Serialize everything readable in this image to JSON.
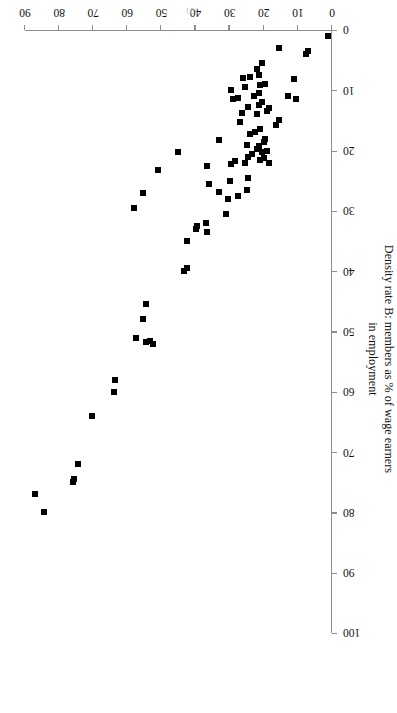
{
  "figure": {
    "page_number": "121",
    "rotation_degrees": 180
  },
  "chart_data": {
    "type": "scatter",
    "title": "",
    "xlabel": "Density rate A: members as % of non-agricultural labour force",
    "ylabel": "Density rate B:  members as % of wage earners in employment",
    "ylabel_line1": "Density rate B:  members as % of wage earners",
    "ylabel_line2": "in employment",
    "xlim": [
      0,
      90
    ],
    "ylim": [
      0,
      100
    ],
    "xticks": [
      0,
      10,
      20,
      30,
      40,
      50,
      60,
      70,
      80,
      90
    ],
    "yticks": [
      0,
      10,
      20,
      30,
      40,
      50,
      60,
      70,
      80,
      90,
      100
    ],
    "grid": false,
    "legend": false,
    "marker": "square",
    "marker_color": "#000000",
    "marker_size_px": 6,
    "points": [
      [
        1.2,
        1.0
      ],
      [
        7.0,
        3.5
      ],
      [
        7.5,
        4.0
      ],
      [
        15.5,
        3.0
      ],
      [
        20.5,
        5.5
      ],
      [
        22.0,
        6.5
      ],
      [
        21.5,
        7.5
      ],
      [
        24.0,
        7.8
      ],
      [
        26.0,
        8.0
      ],
      [
        11.0,
        8.2
      ],
      [
        19.5,
        9.0
      ],
      [
        21.0,
        9.2
      ],
      [
        25.5,
        9.5
      ],
      [
        29.5,
        10.0
      ],
      [
        21.5,
        10.5
      ],
      [
        23.0,
        11.0
      ],
      [
        13.0,
        11.0
      ],
      [
        10.5,
        11.5
      ],
      [
        27.5,
        11.2
      ],
      [
        29.0,
        11.5
      ],
      [
        20.5,
        12.0
      ],
      [
        21.5,
        12.5
      ],
      [
        24.5,
        12.8
      ],
      [
        18.5,
        13.0
      ],
      [
        19.0,
        13.5
      ],
      [
        26.5,
        13.8
      ],
      [
        22.0,
        14.0
      ],
      [
        15.5,
        15.0
      ],
      [
        27.0,
        15.2
      ],
      [
        16.5,
        15.8
      ],
      [
        21.0,
        16.5
      ],
      [
        22.5,
        17.0
      ],
      [
        24.0,
        17.2
      ],
      [
        19.5,
        18.0
      ],
      [
        33.0,
        18.2
      ],
      [
        20.0,
        18.5
      ],
      [
        25.0,
        19.0
      ],
      [
        21.5,
        19.3
      ],
      [
        22.0,
        19.8
      ],
      [
        19.0,
        20.0
      ],
      [
        20.5,
        20.3
      ],
      [
        23.5,
        20.5
      ],
      [
        45.0,
        20.2
      ],
      [
        24.5,
        21.0
      ],
      [
        20.0,
        21.2
      ],
      [
        21.0,
        21.5
      ],
      [
        28.5,
        21.8
      ],
      [
        25.5,
        22.0
      ],
      [
        18.5,
        22.0
      ],
      [
        29.5,
        22.2
      ],
      [
        36.5,
        22.5
      ],
      [
        51.0,
        23.3
      ],
      [
        24.5,
        24.5
      ],
      [
        30.0,
        25.0
      ],
      [
        36.0,
        25.5
      ],
      [
        25.0,
        26.5
      ],
      [
        33.0,
        26.8
      ],
      [
        27.5,
        27.5
      ],
      [
        30.5,
        28.0
      ],
      [
        55.5,
        27.0
      ],
      [
        58.0,
        29.5
      ],
      [
        31.0,
        30.5
      ],
      [
        37.0,
        32.0
      ],
      [
        39.5,
        32.5
      ],
      [
        40.0,
        33.0
      ],
      [
        36.5,
        33.5
      ],
      [
        42.5,
        35.0
      ],
      [
        42.5,
        39.5
      ],
      [
        43.5,
        40.0
      ],
      [
        54.5,
        45.5
      ],
      [
        55.5,
        48.0
      ],
      [
        57.5,
        51.0
      ],
      [
        53.5,
        51.5
      ],
      [
        54.5,
        51.8
      ],
      [
        52.5,
        52.0
      ],
      [
        63.5,
        58.0
      ],
      [
        64.0,
        60.0
      ],
      [
        70.5,
        64.0
      ],
      [
        74.5,
        72.0
      ],
      [
        75.5,
        74.5
      ],
      [
        76.0,
        75.0
      ],
      [
        87.0,
        77.0
      ],
      [
        84.5,
        80.0
      ]
    ]
  }
}
